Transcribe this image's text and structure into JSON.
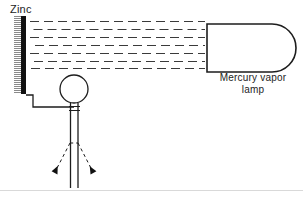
{
  "diagram": {
    "background_color": "#ffffff",
    "stroke_color": "#1d1d1d",
    "ray_color": "#3a3a3a",
    "hatch_color": "#8a8a8a",
    "border_color": "#d9d9d9",
    "width": 303,
    "height": 198
  },
  "labels": {
    "zinc": "Zinc",
    "lamp_line1": "Mercury vapor",
    "lamp_line2": "lamp",
    "lamp_full": "Mercury vapor lamp"
  },
  "components": {
    "zinc_plate": {
      "name": "zinc-plate",
      "x": 21,
      "y": 16,
      "width": 5,
      "height": 78,
      "fill": "#111111"
    },
    "wall_hatching": {
      "name": "wall-hatching",
      "x": 14,
      "y": 16,
      "width": 7,
      "height": 78,
      "line_count": 39
    },
    "mercury_lamp": {
      "name": "mercury-vapor-lamp",
      "x": 207,
      "y": 24,
      "width": 89,
      "height": 48,
      "corner_radius": 24,
      "fill": "#ffffff"
    },
    "electroscope_knob": {
      "name": "electroscope-knob",
      "cx": 74,
      "cy": 89,
      "r": 14
    },
    "electroscope_stem": {
      "name": "electroscope-stem",
      "x1": 70,
      "x2": 78,
      "y_top": 103,
      "y_bottom": 188
    },
    "connecting_wire": {
      "name": "connecting-wire",
      "points": "26,95 33,95 33,107 74,107"
    }
  },
  "light_rays": {
    "name": "uv-light-rays",
    "description": "dashed horizontal ultraviolet light rays from lamp to zinc plate",
    "row_count": 7,
    "x_start": 30,
    "x_end": 205,
    "y_values": [
      21,
      29,
      37,
      45,
      53,
      61,
      68
    ],
    "dash_pattern": "9 5"
  },
  "leaf_divergence": {
    "name": "leaf-divergence-indicators",
    "description": "dashed lines with filled arrowheads showing electroscope leaves spreading apart",
    "left_arrow": {
      "from_x": 70,
      "from_y": 143,
      "to_x": 52,
      "to_y": 176
    },
    "right_arrow": {
      "from_x": 78,
      "from_y": 143,
      "to_x": 96,
      "to_y": 176
    },
    "apex_connector_y": 143
  },
  "border": {
    "bottom_line_y": 190,
    "visible": true
  }
}
